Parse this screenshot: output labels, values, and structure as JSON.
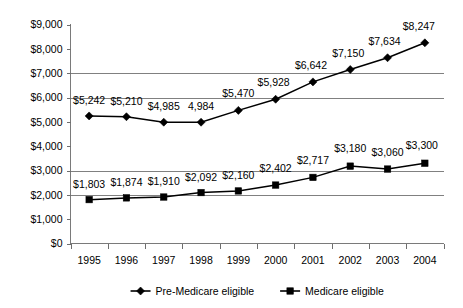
{
  "chart_data": {
    "type": "line",
    "title": "",
    "xlabel": "",
    "ylabel": "",
    "categories": [
      "1995",
      "1996",
      "1997",
      "1998",
      "1999",
      "2000",
      "2001",
      "2002",
      "2003",
      "2004"
    ],
    "ylim": [
      0,
      9000
    ],
    "y_ticks": [
      "$0",
      "$1,000",
      "$2,000",
      "$3,000",
      "$4,000",
      "$5,000",
      "$6,000",
      "$7,000",
      "$8,000",
      "$9,000"
    ],
    "y_tick_values": [
      0,
      1000,
      2000,
      3000,
      4000,
      5000,
      6000,
      7000,
      8000,
      9000
    ],
    "gridlines_at": [
      2000,
      3000,
      6000,
      7000
    ],
    "grid": true,
    "legend_position": "bottom",
    "series": [
      {
        "name": "Pre-Medicare eligible",
        "marker": "diamond",
        "values": [
          5242,
          5210,
          4985,
          4984,
          5470,
          5928,
          6642,
          7150,
          7634,
          8247
        ],
        "labels": [
          "$5,242",
          "$5,210",
          "$4,985",
          "4,984",
          "$5,470",
          "$5,928",
          "$6,642",
          "$7,150",
          "$7,634",
          "$8,247"
        ]
      },
      {
        "name": "Medicare eligible",
        "marker": "square",
        "values": [
          1803,
          1874,
          1910,
          2092,
          2160,
          2402,
          2717,
          3180,
          3060,
          3300
        ],
        "labels": [
          "$1,803",
          "$1,874",
          "$1,910",
          "$2,092",
          "$2,160",
          "$2,402",
          "$2,717",
          "$3,180",
          "$3,060",
          "$3,300"
        ]
      }
    ]
  },
  "legend": {
    "items": [
      {
        "label": "Pre-Medicare eligible",
        "marker": "diamond"
      },
      {
        "label": "Medicare eligible",
        "marker": "square"
      }
    ]
  },
  "colors": {
    "series_line": "#000000",
    "marker": "#000000",
    "gridline": "#808080",
    "axis": "#7a7a7a",
    "background": "#ffffff",
    "text": "#000000"
  }
}
